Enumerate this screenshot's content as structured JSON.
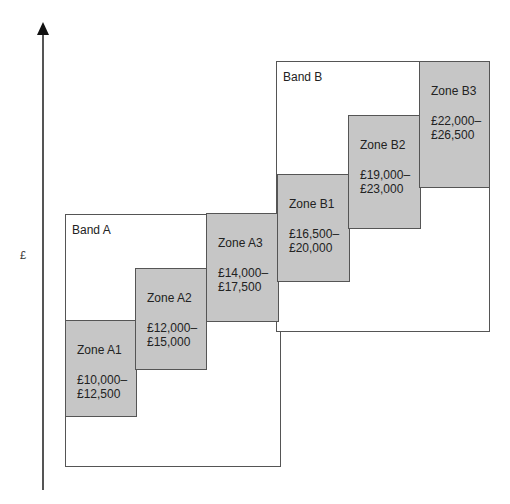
{
  "axis": {
    "label": "£",
    "direction": "up"
  },
  "bands": [
    {
      "label": "Band A"
    },
    {
      "label": "Band B"
    }
  ],
  "zones": [
    {
      "name": "Zone A1",
      "range_line1": "£10,000–",
      "range_line2": "£12,500"
    },
    {
      "name": "Zone A2",
      "range_line1": "£12,000–",
      "range_line2": "£15,000"
    },
    {
      "name": "Zone A3",
      "range_line1": "£14,000–",
      "range_line2": "£17,500"
    },
    {
      "name": "Zone B1",
      "range_line1": "£16,500–",
      "range_line2": "£20,000"
    },
    {
      "name": "Zone B2",
      "range_line1": "£19,000–",
      "range_line2": "£23,000"
    },
    {
      "name": "Zone B3",
      "range_line1": "£22,000–",
      "range_line2": "£26,500"
    }
  ],
  "colors": {
    "zone_fill": "#c6c6c6",
    "band_fill": "#ffffff",
    "border": "#555555"
  }
}
